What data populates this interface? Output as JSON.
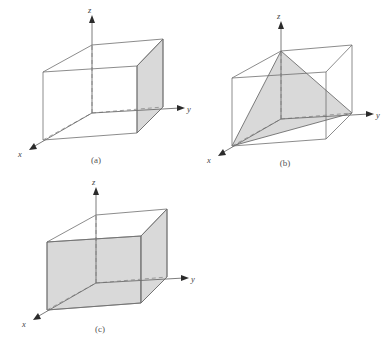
{
  "figure": {
    "title": "",
    "background_color": "#ffffff",
    "line_color": "#6e6e6e",
    "shade_color": "#d9d9d9",
    "dash_color": "#8a8a8a",
    "label_color": "#555555"
  },
  "panels": [
    {
      "id": "a",
      "label": "(a)",
      "axes": {
        "x": "x",
        "y": "y",
        "z": "z"
      },
      "shaded_faces": [
        "right-face"
      ],
      "description": "cube with right side face shaded"
    },
    {
      "id": "b",
      "label": "(b)",
      "axes": {
        "x": "x",
        "y": "y",
        "z": "z"
      },
      "shaded_faces": [
        "triangle-apex-front-right"
      ],
      "description": "cube with inscribed shaded triangle from top-back apex to front-bottom-left and bottom-right corners"
    },
    {
      "id": "c",
      "label": "(c)",
      "axes": {
        "x": "x",
        "y": "y",
        "z": "z"
      },
      "shaded_faces": [
        "left-face",
        "right-face"
      ],
      "description": "cube with left front face and right side face shaded, top face unshaded"
    }
  ]
}
